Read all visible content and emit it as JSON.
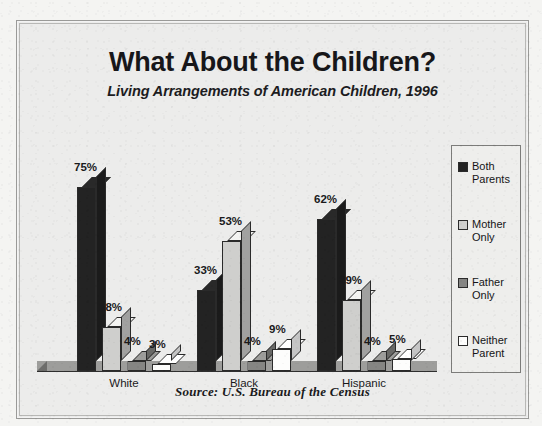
{
  "chart_data": {
    "type": "bar",
    "title": "What About the Children?",
    "subtitle": "Living Arrangements of American Children, 1996",
    "source": "Source: U.S. Bureau of the Census",
    "categories": [
      "White",
      "Black",
      "Hispanic"
    ],
    "xlabel": "",
    "ylabel": "",
    "ylim": [
      0,
      80
    ],
    "grid": false,
    "legend_position": "right",
    "value_suffix": "%",
    "series": [
      {
        "name": "Both Parents",
        "values": [
          75,
          33,
          62
        ],
        "color": "#232323"
      },
      {
        "name": "Mother Only",
        "values": [
          18,
          53,
          29
        ],
        "color": "#cfcfcd"
      },
      {
        "name": "Father Only",
        "values": [
          4,
          4,
          4
        ],
        "color": "#858583"
      },
      {
        "name": "Neither Parent",
        "values": [
          3,
          9,
          5
        ],
        "color": "#fdfdfc"
      }
    ],
    "labels": {
      "White": [
        "75%",
        "18%",
        "4%",
        "3%"
      ],
      "Black": [
        "33%",
        "53%",
        "4%",
        "9%"
      ],
      "Hispanic": [
        "62%",
        "29%",
        "4%",
        "5%"
      ]
    }
  },
  "legend": {
    "items": [
      {
        "line1": "Both",
        "line2": "Parents"
      },
      {
        "line1": "Mother",
        "line2": "Only"
      },
      {
        "line1": "Father",
        "line2": "Only"
      },
      {
        "line1": "Neither",
        "line2": "Parent"
      }
    ]
  }
}
